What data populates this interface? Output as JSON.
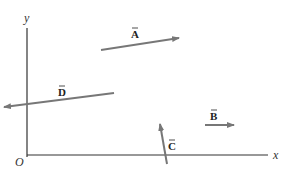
{
  "diagram": {
    "type": "vector-diagram",
    "axes": {
      "x_label": "x",
      "y_label": "y",
      "origin_label": "O",
      "axis_color": "#333333",
      "origin": [
        27,
        155
      ],
      "x_end": [
        268,
        155
      ],
      "y_end": [
        27,
        28
      ]
    },
    "vector_color": "#777777",
    "vectors": [
      {
        "name": "A",
        "label": "A",
        "tail": [
          101,
          50
        ],
        "head": [
          179,
          38
        ],
        "label_pos": [
          131,
          38
        ]
      },
      {
        "name": "B",
        "label": "B",
        "tail": [
          205,
          125
        ],
        "head": [
          234,
          125
        ],
        "label_pos": [
          210,
          120
        ]
      },
      {
        "name": "C",
        "label": "C",
        "tail": [
          167,
          164
        ],
        "head": [
          160,
          124
        ],
        "label_pos": [
          168,
          150
        ]
      },
      {
        "name": "D",
        "label": "D",
        "tail": [
          114,
          93
        ],
        "head": [
          4,
          107
        ],
        "label_pos": [
          58,
          96
        ]
      }
    ]
  }
}
